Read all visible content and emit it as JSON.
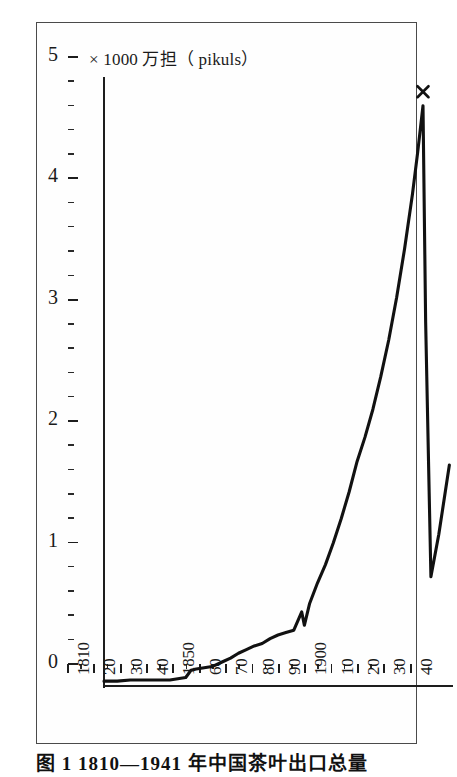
{
  "figure": {
    "title": "× 1000 万担（ pikuls）",
    "caption": "图 1  1810—1941 年中国茶叶出口总量"
  },
  "chart_data": {
    "type": "line",
    "title": "× 1000 万担（ pikuls）",
    "xlabel": "",
    "ylabel": "× 1000 万担（ pikuls）",
    "xlim": [
      1810,
      1942
    ],
    "ylim": [
      0,
      5
    ],
    "grid": false,
    "legend": null,
    "y_ticks": [
      0,
      1,
      2,
      3,
      4,
      5
    ],
    "y_tick_labels": [
      "0",
      "1",
      "2",
      "3",
      "4",
      "5"
    ],
    "y_minor_tick_interval": 0.2,
    "x_ticks": [
      1810,
      1820,
      1830,
      1840,
      1850,
      1860,
      1870,
      1880,
      1890,
      1900,
      1910,
      1920,
      1930,
      1940
    ],
    "x_tick_labels": [
      "1810",
      "20",
      "30",
      "40",
      "1850",
      "60",
      "70",
      "80",
      "90",
      "1900",
      "10",
      "20",
      "30",
      "40"
    ],
    "x_minor_tick_interval": 5,
    "annotations": [
      {
        "label": "×",
        "x": 1931,
        "y": 4.78,
        "marker": "x-cross"
      }
    ],
    "series": [
      {
        "name": "中国茶叶出口量",
        "marker": "none",
        "color": "#111111",
        "x": [
          1810,
          1815,
          1820,
          1825,
          1830,
          1835,
          1838,
          1841,
          1843,
          1845,
          1848,
          1851,
          1855,
          1858,
          1861,
          1864,
          1867,
          1870,
          1873,
          1876,
          1879,
          1882,
          1885,
          1886,
          1888,
          1891,
          1894,
          1897,
          1900,
          1903,
          1906,
          1909,
          1912,
          1915,
          1918,
          1921,
          1924,
          1927,
          1929,
          1931,
          1932,
          1934,
          1937,
          1941
        ],
        "y": [
          0.04,
          0.04,
          0.05,
          0.05,
          0.05,
          0.05,
          0.06,
          0.07,
          0.13,
          0.14,
          0.15,
          0.16,
          0.2,
          0.23,
          0.27,
          0.3,
          0.33,
          0.35,
          0.39,
          0.42,
          0.44,
          0.46,
          0.61,
          0.5,
          0.68,
          0.85,
          1.0,
          1.18,
          1.38,
          1.6,
          1.85,
          2.05,
          2.28,
          2.55,
          2.85,
          3.2,
          3.6,
          4.05,
          4.4,
          4.78,
          3.0,
          0.9,
          1.25,
          1.82
        ]
      }
    ]
  }
}
